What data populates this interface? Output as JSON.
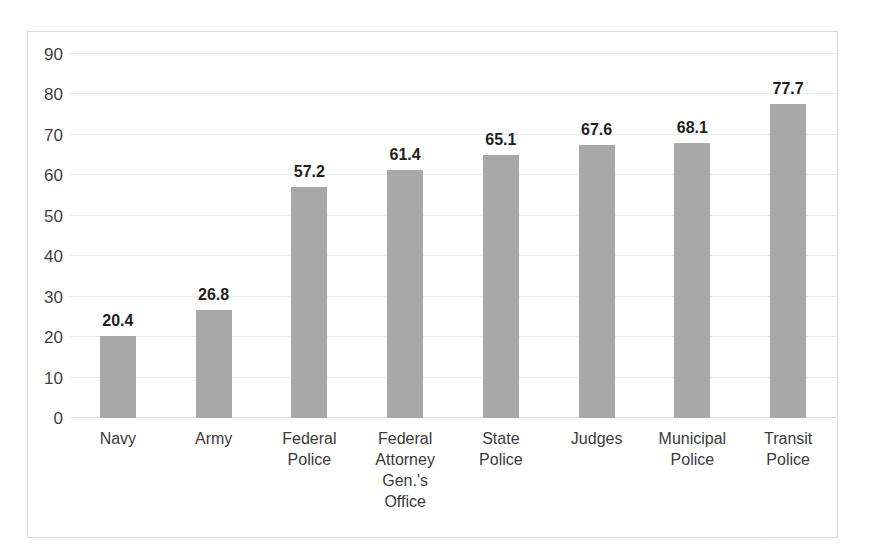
{
  "chart_data": {
    "type": "bar",
    "title": "",
    "subtitle": "",
    "xlabel": "",
    "ylabel": "",
    "ylim": [
      0,
      90
    ],
    "yticks": [
      0,
      10,
      20,
      30,
      40,
      50,
      60,
      70,
      80,
      90
    ],
    "ytick_labels": [
      "0",
      "10",
      "20",
      "30",
      "40",
      "50",
      "60",
      "70",
      "80",
      "90"
    ],
    "grid": true,
    "legend": false,
    "legend_position": "none",
    "bar_color": "#a8a8a8",
    "frame_color": "#dcdcdc",
    "gridline_color": "#ebebeb",
    "label_color": "#1f1f1f",
    "categories": [
      "Navy",
      "Army",
      "Federal Police",
      "Federal Attorney Gen.'s Office",
      "State Police",
      "Judges",
      "Municipal Police",
      "Transit Police"
    ],
    "category_lines": [
      [
        "Navy"
      ],
      [
        "Army"
      ],
      [
        "Federal",
        "Police"
      ],
      [
        "Federal",
        "Attorney",
        "Gen.'s",
        "Office"
      ],
      [
        "State",
        "Police"
      ],
      [
        "Judges"
      ],
      [
        "Municipal",
        "Police"
      ],
      [
        "Transit",
        "Police"
      ]
    ],
    "values": [
      20.4,
      26.8,
      57.2,
      61.4,
      65.1,
      67.6,
      68.1,
      77.7
    ],
    "value_labels": [
      "20.4",
      "26.8",
      "57.2",
      "61.4",
      "65.1",
      "67.6",
      "68.1",
      "77.7"
    ]
  }
}
